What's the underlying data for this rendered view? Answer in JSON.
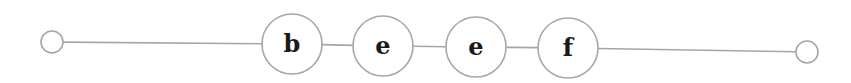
{
  "diagram": {
    "type": "linked-list",
    "colors": {
      "stroke": "#a6a6a6",
      "fill": "#ffffff",
      "text": "#1a1a1a"
    },
    "start_terminal": {
      "cx": 52,
      "cy": 42,
      "r": 11
    },
    "end_terminal": {
      "cx": 807,
      "cy": 52,
      "r": 11
    },
    "nodes": [
      {
        "label": "b",
        "cx": 292,
        "cy": 44,
        "r": 30
      },
      {
        "label": "e",
        "cx": 383,
        "cy": 46,
        "r": 30
      },
      {
        "label": "e",
        "cx": 476,
        "cy": 47,
        "r": 30
      },
      {
        "label": "f",
        "cx": 568,
        "cy": 48,
        "r": 30
      }
    ]
  }
}
